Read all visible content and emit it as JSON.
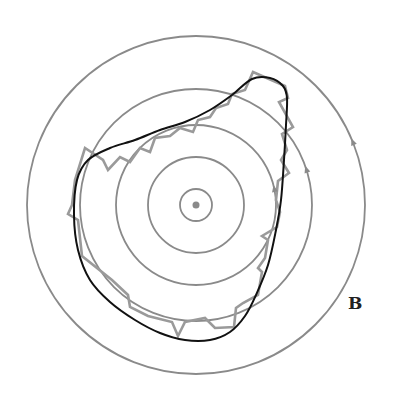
{
  "diagram": {
    "center": {
      "x": 196,
      "y": 205
    },
    "circles": [
      {
        "r": 16,
        "arrow": null
      },
      {
        "r": 48,
        "arrow": null
      },
      {
        "r": 80,
        "arrow": {
          "angle_deg": 12
        }
      },
      {
        "r": 116,
        "arrow": {
          "angle_deg": 18
        }
      },
      {
        "r": 169,
        "arrow": {
          "angle_deg": 22
        }
      }
    ],
    "center_dot_r": 3.5,
    "label": "B",
    "colors": {
      "circles": "#8a8a8a",
      "smooth_curve": "#111111",
      "jagged_curve": "#9a9a9a",
      "label": "#222222"
    },
    "smooth_curve_points": [
      [
        252,
        79
      ],
      [
        270,
        78
      ],
      [
        283,
        86
      ],
      [
        287,
        98
      ],
      [
        286,
        125
      ],
      [
        284,
        160
      ],
      [
        281,
        200
      ],
      [
        276,
        230
      ],
      [
        268,
        265
      ],
      [
        256,
        295
      ],
      [
        245,
        316
      ],
      [
        230,
        332
      ],
      [
        210,
        340
      ],
      [
        185,
        340
      ],
      [
        160,
        333
      ],
      [
        135,
        320
      ],
      [
        110,
        302
      ],
      [
        90,
        280
      ],
      [
        78,
        250
      ],
      [
        74,
        215
      ],
      [
        77,
        180
      ],
      [
        88,
        160
      ],
      [
        110,
        148
      ],
      [
        135,
        140
      ],
      [
        160,
        130
      ],
      [
        185,
        122
      ],
      [
        210,
        110
      ],
      [
        232,
        95
      ]
    ],
    "jagged_curve_points": [
      [
        253,
        72
      ],
      [
        285,
        86
      ],
      [
        288,
        98
      ],
      [
        279,
        102
      ],
      [
        293,
        127
      ],
      [
        282,
        134
      ],
      [
        287,
        150
      ],
      [
        281,
        160
      ],
      [
        289,
        173
      ],
      [
        278,
        181
      ],
      [
        276,
        200
      ],
      [
        280,
        212
      ],
      [
        277,
        227
      ],
      [
        262,
        236
      ],
      [
        268,
        240
      ],
      [
        265,
        258
      ],
      [
        258,
        268
      ],
      [
        262,
        272
      ],
      [
        258,
        295
      ],
      [
        243,
        303
      ],
      [
        236,
        308
      ],
      [
        234,
        327
      ],
      [
        215,
        328
      ],
      [
        205,
        318
      ],
      [
        185,
        322
      ],
      [
        178,
        336
      ],
      [
        172,
        322
      ],
      [
        148,
        316
      ],
      [
        130,
        307
      ],
      [
        128,
        295
      ],
      [
        112,
        280
      ],
      [
        82,
        256
      ],
      [
        78,
        220
      ],
      [
        68,
        214
      ],
      [
        72,
        205
      ],
      [
        75,
        180
      ],
      [
        85,
        148
      ],
      [
        103,
        160
      ],
      [
        108,
        170
      ],
      [
        120,
        157
      ],
      [
        130,
        162
      ],
      [
        140,
        148
      ],
      [
        150,
        152
      ],
      [
        155,
        138
      ],
      [
        170,
        136
      ],
      [
        180,
        128
      ],
      [
        193,
        132
      ],
      [
        198,
        120
      ],
      [
        210,
        117
      ],
      [
        216,
        108
      ],
      [
        228,
        104
      ],
      [
        232,
        94
      ],
      [
        245,
        90
      ]
    ]
  }
}
